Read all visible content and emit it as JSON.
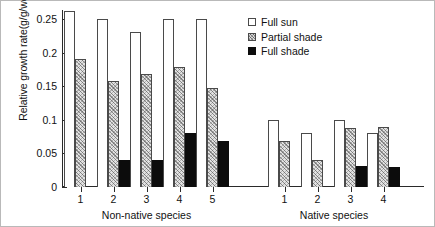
{
  "chart_data": {
    "type": "bar",
    "title": "",
    "xlabel": "",
    "ylabel": "Relative growth rate(g/g/week)",
    "ylim": [
      0,
      0.27
    ],
    "yticks": [
      "0",
      "0.05",
      "0.1",
      "0.15",
      "0.2",
      "0.25"
    ],
    "ytick_values": [
      0,
      0.05,
      0.1,
      0.15,
      0.2,
      0.25
    ],
    "grid": false,
    "legend_position": "top-right",
    "legend": [
      "Full sun",
      "Partial shade",
      "Full shade"
    ],
    "panels": [
      {
        "name": "Non-native species",
        "categories": [
          "1",
          "2",
          "3",
          "4",
          "5"
        ],
        "series": [
          {
            "name": "Full sun",
            "values": [
              0.262,
              0.25,
              0.23,
              0.25,
              0.25
            ]
          },
          {
            "name": "Partial shade",
            "values": [
              0.19,
              0.158,
              0.168,
              0.178,
              0.148
            ]
          },
          {
            "name": "Full shade",
            "values": [
              null,
              0.04,
              0.04,
              0.08,
              0.068
            ]
          }
        ]
      },
      {
        "name": "Native species",
        "categories": [
          "1",
          "2",
          "3",
          "4"
        ],
        "series": [
          {
            "name": "Full sun",
            "values": [
              0.1,
              0.08,
              0.1,
              0.08
            ]
          },
          {
            "name": "Partial shade",
            "values": [
              0.068,
              0.04,
              0.088,
              0.09
            ]
          },
          {
            "name": "Full shade",
            "values": [
              null,
              null,
              0.032,
              0.03
            ]
          }
        ]
      }
    ]
  },
  "axis": {
    "y_label": "Relative growth rate(g/g/week)",
    "y_ticks": [
      "0",
      "0.05",
      "0.1",
      "0.15",
      "0.2",
      "0.25"
    ],
    "panel_captions": [
      "Non-native species",
      "Native species"
    ],
    "x_tick_labels_nonnative": [
      "1",
      "2",
      "3",
      "4",
      "5"
    ],
    "x_tick_labels_native": [
      "1",
      "2",
      "3",
      "4"
    ]
  },
  "legend": {
    "items": [
      {
        "label": "Full sun",
        "key": "sun",
        "color": "#ffffff"
      },
      {
        "label": "Partial shade",
        "key": "partial",
        "color": "#d9d9d9"
      },
      {
        "label": "Full shade",
        "key": "full",
        "color": "#0c0c0c"
      }
    ]
  }
}
